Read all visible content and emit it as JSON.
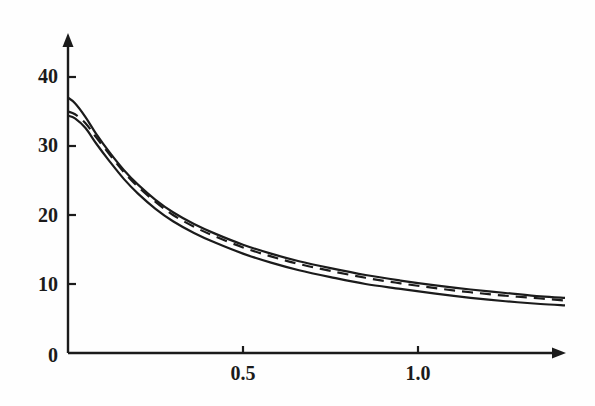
{
  "chart_data": {
    "type": "line",
    "title": "",
    "subtitle": "",
    "xlabel": "",
    "ylabel": "",
    "xlim": [
      0,
      1.42
    ],
    "ylim": [
      0,
      43
    ],
    "grid": false,
    "legend": "none",
    "background_color": "#fefefe",
    "axis_color": "#1b1b1b",
    "x_ticks": [
      {
        "value": 0.5,
        "label": "0.5"
      },
      {
        "value": 1.0,
        "label": "1.0"
      }
    ],
    "y_ticks": [
      {
        "value": 0,
        "label": "0"
      },
      {
        "value": 10,
        "label": "10"
      },
      {
        "value": 20,
        "label": "20"
      },
      {
        "value": 30,
        "label": "30"
      },
      {
        "value": 40,
        "label": "40"
      }
    ],
    "series": [
      {
        "name": "upper-solid-curve",
        "style": "solid",
        "color": "#1b1b1b",
        "x": [
          0.0,
          0.02,
          0.05,
          0.08,
          0.12,
          0.16,
          0.2,
          0.25,
          0.3,
          0.36,
          0.42,
          0.5,
          0.58,
          0.66,
          0.75,
          0.85,
          0.95,
          1.05,
          1.15,
          1.25,
          1.35,
          1.42
        ],
        "y": [
          37.0,
          36.2,
          34.2,
          31.8,
          29.0,
          26.5,
          24.4,
          22.2,
          20.4,
          18.7,
          17.3,
          15.7,
          14.4,
          13.3,
          12.3,
          11.3,
          10.5,
          9.8,
          9.2,
          8.7,
          8.2,
          8.0
        ]
      },
      {
        "name": "middle-dashed-curve",
        "style": "dashed",
        "color": "#1b1b1b",
        "dash_pattern": "11 7",
        "x": [
          0.0,
          0.02,
          0.05,
          0.08,
          0.12,
          0.16,
          0.2,
          0.25,
          0.3,
          0.36,
          0.42,
          0.5,
          0.58,
          0.66,
          0.75,
          0.85,
          0.95,
          1.05,
          1.15,
          1.25,
          1.35,
          1.42
        ],
        "y": [
          35.0,
          34.6,
          33.3,
          31.3,
          28.7,
          26.2,
          24.1,
          21.9,
          20.0,
          18.3,
          16.9,
          15.3,
          14.0,
          12.9,
          11.9,
          10.9,
          10.1,
          9.4,
          8.8,
          8.3,
          7.9,
          7.6
        ]
      },
      {
        "name": "lower-solid-curve",
        "style": "solid",
        "color": "#1b1b1b",
        "x": [
          0.0,
          0.02,
          0.05,
          0.08,
          0.12,
          0.16,
          0.2,
          0.25,
          0.3,
          0.36,
          0.42,
          0.5,
          0.58,
          0.66,
          0.75,
          0.85,
          0.95,
          1.05,
          1.15,
          1.25,
          1.35,
          1.42
        ],
        "y": [
          34.4,
          34.0,
          32.6,
          30.4,
          27.7,
          25.2,
          23.1,
          20.9,
          19.1,
          17.4,
          16.0,
          14.4,
          13.1,
          12.0,
          11.0,
          10.0,
          9.3,
          8.6,
          8.0,
          7.5,
          7.1,
          6.9
        ]
      }
    ]
  },
  "axes": {
    "x_axis_name": "x-axis-arrow",
    "y_axis_name": "y-axis-arrow"
  }
}
